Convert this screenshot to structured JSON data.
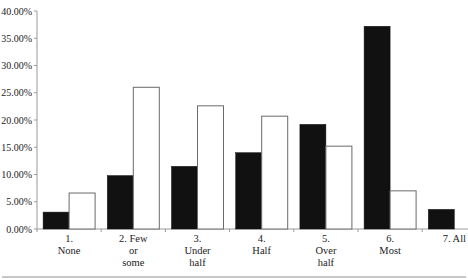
{
  "chart_data": {
    "type": "bar",
    "title": "",
    "xlabel": "",
    "ylabel": "",
    "ylim": [
      0,
      40
    ],
    "yticks": [
      0,
      5,
      10,
      15,
      20,
      25,
      30,
      35,
      40
    ],
    "ytick_labels": [
      "0.00%",
      "5.00%",
      "10.00%",
      "15.00%",
      "20.00%",
      "25.00%",
      "30.00%",
      "35.00%",
      "40.00%"
    ],
    "grid": false,
    "legend": "none",
    "categories": [
      [
        "1.",
        "None"
      ],
      [
        "2. Few",
        "or",
        "some"
      ],
      [
        "3.",
        "Under",
        "half"
      ],
      [
        "4.",
        "Half"
      ],
      [
        "5.",
        "Over",
        "half"
      ],
      [
        "6.",
        "Most"
      ],
      [
        "7. All"
      ]
    ],
    "series": [
      {
        "name": "Series 1 (black)",
        "color": "#111111",
        "values": [
          3.1,
          9.8,
          11.5,
          14.0,
          19.2,
          37.2,
          3.6
        ]
      },
      {
        "name": "Series 2 (white)",
        "color": "#ffffff",
        "values": [
          6.6,
          26.0,
          22.6,
          20.7,
          15.2,
          7.0,
          0
        ]
      }
    ]
  }
}
